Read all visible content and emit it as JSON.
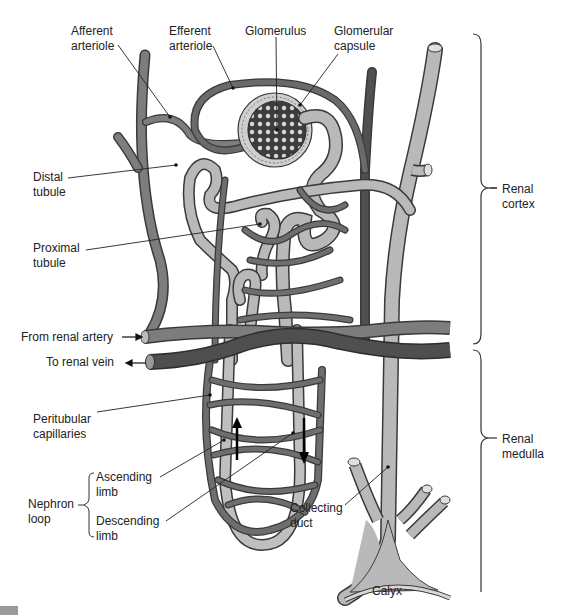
{
  "figure": {
    "regions": [
      {
        "id": "renal-cortex",
        "line1": "Renal",
        "line2": "cortex"
      },
      {
        "id": "renal-medulla",
        "line1": "Renal",
        "line2": "medulla"
      }
    ],
    "labels": {
      "afferent_arteriole": {
        "line1": "Afferent",
        "line2": "arteriole"
      },
      "efferent_arteriole": {
        "line1": "Efferent",
        "line2": "arteriole"
      },
      "glomerulus": {
        "line1": "Glomerulus"
      },
      "glomerular_capsule": {
        "line1": "Glomerular",
        "line2": "capsule"
      },
      "distal_tubule": {
        "line1": "Distal",
        "line2": "tubule"
      },
      "proximal_tubule": {
        "line1": "Proximal",
        "line2": "tubule"
      },
      "from_renal_artery": {
        "line1": "From renal artery"
      },
      "to_renal_vein": {
        "line1": "To renal vein"
      },
      "peritubular_capillaries": {
        "line1": "Peritubular",
        "line2": "capillaries"
      },
      "nephron_loop": {
        "line1": "Nephron",
        "line2": "loop"
      },
      "ascending_limb": {
        "line1": "Ascending",
        "line2": "limb"
      },
      "descending_limb": {
        "line1": "Descending",
        "line2": "limb"
      },
      "collecting_duct": {
        "line1": "Collecting",
        "line2": "duct"
      },
      "calyx": {
        "line1": "Calyx"
      },
      "renal_cortex": {
        "line1": "Renal",
        "line2": "cortex"
      },
      "renal_medulla": {
        "line1": "Renal",
        "line2": "medulla"
      }
    },
    "colors": {
      "arteriole_fill": "#7d7d7d",
      "vein_fill": "#4f4f4f",
      "tubule_fill": "#b9b9b9",
      "outline": "#3a3a3a",
      "text": "#222222",
      "background": "#ffffff"
    }
  }
}
